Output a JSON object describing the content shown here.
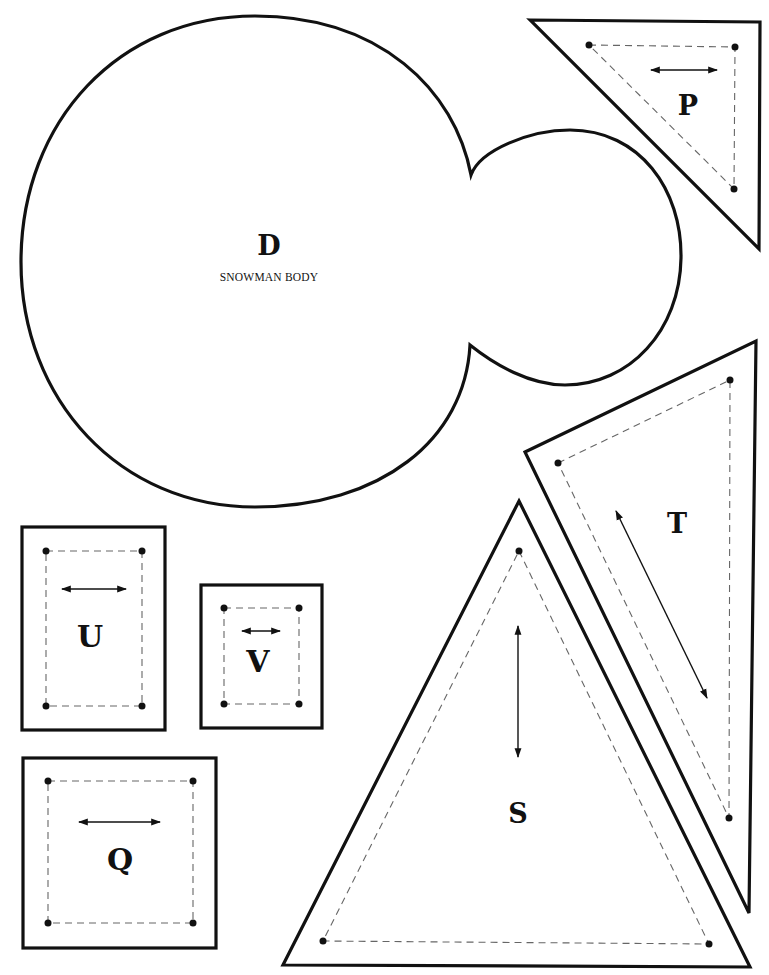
{
  "sheet": {
    "background": "#ffffff",
    "line_color": "#111111",
    "seam_color": "#666666"
  },
  "pieces": {
    "D": {
      "letter": "D",
      "name": "SNOWMAN BODY"
    },
    "P": {
      "letter": "P"
    },
    "T": {
      "letter": "T"
    },
    "S": {
      "letter": "S"
    },
    "U": {
      "letter": "U"
    },
    "V": {
      "letter": "V"
    },
    "Q": {
      "letter": "Q"
    }
  }
}
